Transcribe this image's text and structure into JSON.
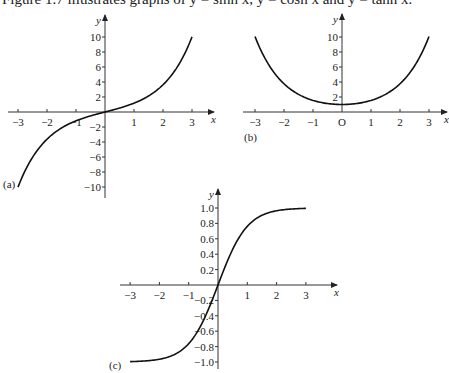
{
  "caption": {
    "text": "Figure 1.7 illustrates graphs of y = sinh x, y = cosh x and y = tanh x."
  },
  "chart_data": [
    {
      "id": "a",
      "type": "line",
      "panel_label": "(a)",
      "function": "y = sinh x",
      "xlabel": "x",
      "ylabel": "y",
      "xlim": [
        -3,
        3
      ],
      "ylim": [
        -10,
        10
      ],
      "x_ticks": [
        "-3",
        "-2",
        "-1",
        "1",
        "2",
        "3"
      ],
      "y_ticks": [
        "10",
        "8",
        "6",
        "4",
        "2",
        "-2",
        "-4",
        "-6",
        "-8",
        "-10"
      ],
      "x": [
        -3,
        -2.5,
        -2,
        -1.5,
        -1,
        -0.5,
        0,
        0.5,
        1,
        1.5,
        2,
        2.5,
        3
      ],
      "y": [
        -10.02,
        -6.05,
        -3.63,
        -2.13,
        -1.18,
        -0.52,
        0,
        0.52,
        1.18,
        2.13,
        3.63,
        6.05,
        10.02
      ],
      "grid": false
    },
    {
      "id": "b",
      "type": "line",
      "panel_label": "(b)",
      "function": "y = cosh x",
      "xlabel": "x",
      "ylabel": "y",
      "origin_label": "O",
      "xlim": [
        -3,
        3
      ],
      "ylim": [
        0,
        10
      ],
      "x_ticks": [
        "-3",
        "-2",
        "-1",
        "O",
        "1",
        "2",
        "3"
      ],
      "y_ticks": [
        "10",
        "8",
        "6",
        "4",
        "2"
      ],
      "x": [
        -3,
        -2.5,
        -2,
        -1.5,
        -1,
        -0.5,
        0,
        0.5,
        1,
        1.5,
        2,
        2.5,
        3
      ],
      "y": [
        10.07,
        6.13,
        3.76,
        2.35,
        1.54,
        1.13,
        1,
        1.13,
        1.54,
        2.35,
        3.76,
        6.13,
        10.07
      ],
      "grid": false
    },
    {
      "id": "c",
      "type": "line",
      "panel_label": "(c)",
      "function": "y = tanh x",
      "xlabel": "x",
      "ylabel": "y",
      "xlim": [
        -3,
        3
      ],
      "ylim": [
        -1,
        1
      ],
      "x_ticks": [
        "-3",
        "-2",
        "-1",
        "1",
        "2",
        "3"
      ],
      "y_ticks": [
        "1.0",
        "0.8",
        "0.6",
        "0.4",
        "0.2",
        "-0.2",
        "-0.4",
        "-0.6",
        "-0.8",
        "-1.0"
      ],
      "x": [
        -3,
        -2.5,
        -2,
        -1.5,
        -1,
        -0.5,
        0,
        0.5,
        1,
        1.5,
        2,
        2.5,
        3
      ],
      "y": [
        -0.995,
        -0.987,
        -0.964,
        -0.905,
        -0.762,
        -0.462,
        0,
        0.462,
        0.762,
        0.905,
        0.964,
        0.987,
        0.995
      ],
      "grid": false
    }
  ]
}
